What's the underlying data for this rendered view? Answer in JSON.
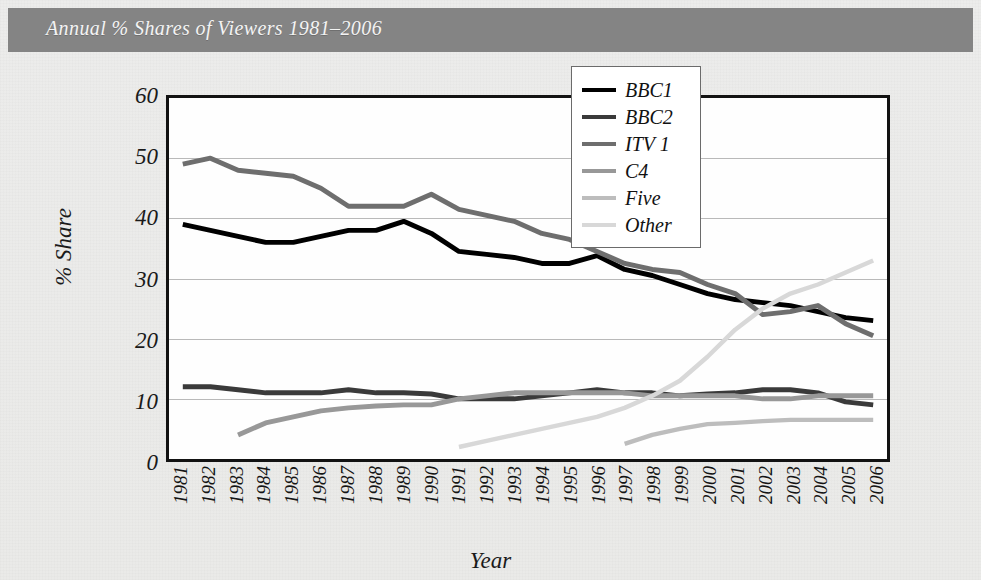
{
  "title": "Annual % Shares of Viewers 1981–2006",
  "axes": {
    "ylabel": "% Share",
    "xlabel": "Year",
    "yticks": [
      "0",
      "10",
      "20",
      "30",
      "40",
      "50",
      "60"
    ]
  },
  "legend": {
    "items": [
      {
        "label": "BBC1",
        "color": "#000000"
      },
      {
        "label": "BBC2",
        "color": "#3a3a3a"
      },
      {
        "label": "ITV 1",
        "color": "#6e6e6e"
      },
      {
        "label": "C4",
        "color": "#989898"
      },
      {
        "label": "Five",
        "color": "#bdbdbd"
      },
      {
        "label": "Other",
        "color": "#d8d8d8"
      }
    ]
  },
  "chart_data": {
    "type": "line",
    "title": "Annual % Shares of Viewers 1981–2006",
    "xlabel": "Year",
    "ylabel": "% Share",
    "ylim": [
      0,
      60
    ],
    "ytick_step": 10,
    "grid": "horizontal",
    "legend_position": "top-right",
    "categories": [
      "1981",
      "1982",
      "1983",
      "1984",
      "1985",
      "1986",
      "1987",
      "1988",
      "1989",
      "1990",
      "1991",
      "1992",
      "1993",
      "1994",
      "1995",
      "1996",
      "1997",
      "1998",
      "1999",
      "2000",
      "2001",
      "2002",
      "2003",
      "2004",
      "2005",
      "2006"
    ],
    "series": [
      {
        "name": "BBC1",
        "color": "#000000",
        "values": [
          39,
          38,
          37,
          36,
          36,
          37,
          38,
          38,
          39.5,
          37.5,
          34.5,
          34,
          33.5,
          32.5,
          32.5,
          33.8,
          31.5,
          30.5,
          29,
          27.5,
          26.5,
          26,
          25.5,
          24.5,
          23.5,
          23
        ]
      },
      {
        "name": "BBC2",
        "color": "#3a3a3a",
        "values": [
          12,
          12,
          11.5,
          11,
          11,
          11,
          11.5,
          11,
          11,
          10.8,
          10,
          10,
          10,
          10.5,
          11,
          11.5,
          11,
          11,
          10.5,
          10.8,
          11,
          11.5,
          11.5,
          11,
          9.5,
          9
        ]
      },
      {
        "name": "ITV 1",
        "color": "#6e6e6e",
        "values": [
          49,
          50,
          48,
          47.5,
          47,
          45,
          42,
          42,
          42,
          44,
          41.5,
          40.5,
          39.5,
          37.5,
          36.5,
          34.5,
          32.5,
          31.5,
          31,
          29,
          27.5,
          24,
          24.5,
          25.5,
          22.5,
          20.5
        ]
      },
      {
        "name": "C4",
        "color": "#989898",
        "values": [
          null,
          null,
          4,
          6,
          7,
          8,
          8.5,
          8.8,
          9,
          9,
          10,
          10.5,
          11,
          11,
          11,
          11,
          11,
          10.5,
          10.5,
          10.5,
          10.5,
          10,
          10,
          10.5,
          10.5,
          10.5
        ]
      },
      {
        "name": "Five",
        "color": "#bdbdbd",
        "values": [
          null,
          null,
          null,
          null,
          null,
          null,
          null,
          null,
          null,
          null,
          null,
          null,
          null,
          null,
          null,
          null,
          2.5,
          4,
          5,
          5.8,
          6,
          6.3,
          6.5,
          6.5,
          6.5,
          6.5
        ]
      },
      {
        "name": "Other",
        "color": "#d8d8d8",
        "values": [
          null,
          null,
          null,
          null,
          null,
          null,
          null,
          null,
          null,
          null,
          2,
          3,
          4,
          5,
          6,
          7,
          8.5,
          10.5,
          13,
          17,
          21.5,
          25,
          27.5,
          29,
          31,
          33
        ]
      }
    ]
  }
}
